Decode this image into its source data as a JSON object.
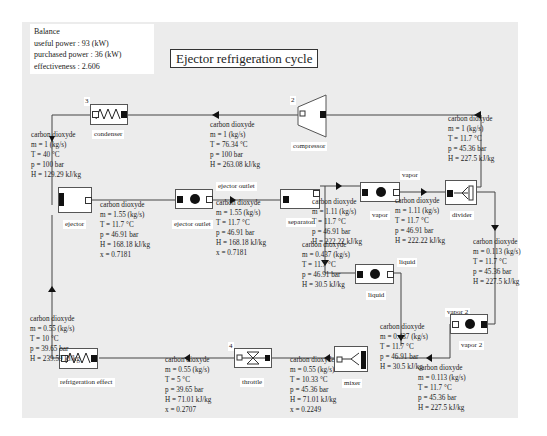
{
  "balance": {
    "heading": "Balance",
    "useful_power": "useful power : 93 (kW)",
    "purchased_power": "purchased power : 36 (kW)",
    "effectiveness": "effectiveness : 2.606"
  },
  "title": "Ejector refrigeration cycle",
  "components": {
    "condenser": {
      "number": "3",
      "label": "condenser"
    },
    "compressor": {
      "number": "2",
      "label": "compressor"
    },
    "ejector": {
      "label": "ejector"
    },
    "ejector_outlet": {
      "label": "ejector outlet",
      "port_label": "ejector outlet"
    },
    "separator": {
      "label": "separator"
    },
    "vapor": {
      "label": "vapor",
      "port_label": "vapor"
    },
    "divider": {
      "label": "divider"
    },
    "liquid": {
      "label": "liquid",
      "port_label": "liquid"
    },
    "vapor2": {
      "label": "vapor 2",
      "port_label": "vapor 2"
    },
    "mixer": {
      "label": "mixer"
    },
    "throttle": {
      "number": "4",
      "label": "throttle"
    },
    "refrigeration_effect": {
      "label": "refrigeration effect"
    }
  },
  "streams": {
    "condenser_out": [
      "carbon dioxyde",
      "m = 1 (kg/s)",
      "T = 40 °C",
      "p = 100 bar",
      "H = 129.29 kJ/kg"
    ],
    "compressor_out": [
      "carbon dioxyde",
      "m = 1 (kg/s)",
      "T = 76.34 °C",
      "p = 100 bar",
      "H = 263.08 kJ/kg"
    ],
    "divider_to_compressor": [
      "carbon dioxyde",
      "m = 1 (kg/s)",
      "T = 11.7 °C",
      "p = 45.36 bar",
      "H = 227.5 kJ/kg"
    ],
    "ejector_out": [
      "carbon dioxyde",
      "m = 1.55 (kg/s)",
      "T = 11.7 °C",
      "p = 46.91 bar",
      "H = 168.18 kJ/kg",
      "x = 0.7181"
    ],
    "ejector_outlet_out": [
      "carbon dioxyde",
      "m = 1.55 (kg/s)",
      "T = 11.7 °C",
      "p = 46.91 bar",
      "H = 168.18 kJ/kg",
      "x = 0.7181"
    ],
    "separator_vapor": [
      "carbon dioxyde",
      "m = 1.11 (kg/s)",
      "T = 11.7 °C",
      "p = 46.91 bar",
      "H = 222.22 kJ/kg"
    ],
    "vapor_out": [
      "carbon dioxyde",
      "m = 1.11 (kg/s)",
      "T = 11.7 °C",
      "p = 46.91 bar",
      "H = 222.22 kJ/kg"
    ],
    "separator_liquid": [
      "carbon dioxyde",
      "m = 0.437 (kg/s)",
      "T = 11.7 °C",
      "p = 46.91 bar",
      "H = 30.5 kJ/kg"
    ],
    "divider_to_vapor2": [
      "carbon dioxyde",
      "m = 0.113 (kg/s)",
      "T = 11.7 °C",
      "p = 45.36 bar",
      "H = 227.5 kJ/kg"
    ],
    "liquid_out": [
      "carbon dioxyde",
      "m = 0.437 (kg/s)",
      "T = 11.7 °C",
      "p = 46.91 bar",
      "H = 30.5 kJ/kg"
    ],
    "vapor2_out": [
      "carbon dioxyde",
      "m = 0.113 (kg/s)",
      "T = 11.7 °C",
      "p = 45.36 bar",
      "H = 227.5 kJ/kg"
    ],
    "mixer_out": [
      "carbon dioxyde",
      "m = 0.55 (kg/s)",
      "T = 10.33 °C",
      "p = 45.36 bar",
      "H = 71.01 kJ/kg",
      "x = 0.2249"
    ],
    "throttle_out": [
      "carbon dioxyde",
      "m = 0.55 (kg/s)",
      "T = 5 °C",
      "p = 39.65 bar",
      "H = 71.01 kJ/kg",
      "x = 0.2707"
    ],
    "refrigeration_out": [
      "carbon dioxyde",
      "m = 0.55 (kg/s)",
      "T = 10 °C",
      "p = 39.65 bar",
      "H = 239.59 kJ/kg"
    ]
  }
}
